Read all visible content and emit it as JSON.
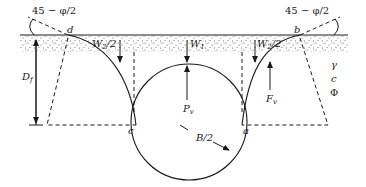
{
  "diagram": {
    "type": "geotechnical-free-body-diagram",
    "labels": {
      "angle_left": "45 − φ/2",
      "angle_right": "45 − φ/2",
      "point_d": "d",
      "point_b": "b",
      "point_c": "c",
      "point_a": "a",
      "weight_side_left": "W",
      "weight_side_left_sub": "2",
      "weight_side_left_div": "/2",
      "weight_center": "W",
      "weight_center_sub": "1",
      "weight_side_right": "W",
      "weight_side_right_sub": "2",
      "weight_side_right_div": "/2",
      "depth": "D",
      "depth_sub": "f",
      "uplift": "P",
      "uplift_sub": "v",
      "shear_force": "F",
      "shear_force_sub": "v",
      "radius": "B/2",
      "soil_gamma": "γ",
      "soil_c": "c",
      "soil_phi": "Φ"
    },
    "colors": {
      "line": "#1a1a1a",
      "background": "#ffffff",
      "soil_dots": "#555555"
    }
  }
}
